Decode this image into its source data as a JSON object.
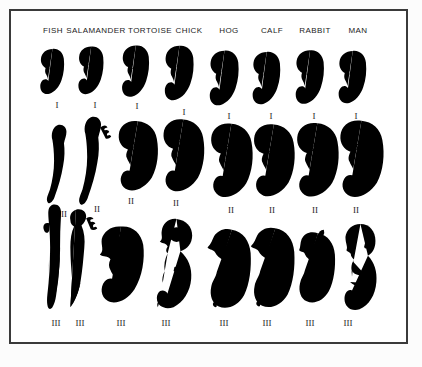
{
  "palette": {
    "background": "#fcfcfc",
    "frame_fill": "#ffffff",
    "frame_border": "#3a3a3a",
    "line_art": "#2b2b2b",
    "text": "#1c1c1c"
  },
  "figure": {
    "type": "comparative-embryology-grid",
    "columns": [
      {
        "id": "fish",
        "label": "FISH"
      },
      {
        "id": "salamander",
        "label": "SALAMANDER"
      },
      {
        "id": "tortoise",
        "label": "TORTOISE"
      },
      {
        "id": "chick",
        "label": "CHICK"
      },
      {
        "id": "hog",
        "label": "HOG"
      },
      {
        "id": "calf",
        "label": "CALF"
      },
      {
        "id": "rabbit",
        "label": "RABBIT"
      },
      {
        "id": "man",
        "label": "MAN"
      }
    ],
    "stages": [
      {
        "numeral": "I"
      },
      {
        "numeral": "II"
      },
      {
        "numeral": "III"
      }
    ]
  }
}
